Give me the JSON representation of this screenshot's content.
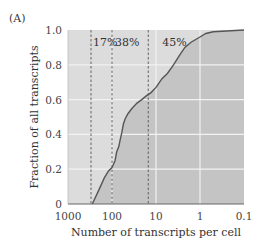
{
  "panel_label": "(A)",
  "colors": {
    "plot_bg": "#dcdcdc",
    "area_fill": "#c4c4c4",
    "curve": "#555555",
    "grid": "#f2f2f2",
    "dashed": "#555555",
    "axis": "#666666"
  },
  "chart_data": {
    "type": "area",
    "title": "",
    "xlabel": "Number of transcripts per cell",
    "ylabel": "Fraction of all transcripts",
    "x_scale": "log",
    "x_reversed": true,
    "xlim": [
      1000,
      0.1
    ],
    "ylim": [
      0,
      1.0
    ],
    "grid": true,
    "x_ticks": [
      "1000",
      "100",
      "10",
      "1",
      "0.1"
    ],
    "y_ticks": [
      "0",
      "0.2",
      "0.4",
      "0.6",
      "0.8",
      "1.0"
    ],
    "dashed_lines_x": [
      300,
      100,
      15
    ],
    "annotations": [
      {
        "text": "17%",
        "region": "300–100"
      },
      {
        "text": "38%",
        "region": "100–15"
      },
      {
        "text": "45%",
        "region": "15–0.1"
      }
    ],
    "series": [
      {
        "name": "cumulative fraction",
        "x": [
          280,
          200,
          150,
          120,
          100,
          85,
          78,
          70,
          65,
          60,
          55,
          50,
          43,
          35,
          27,
          21,
          17,
          13,
          10,
          7.3,
          5.5,
          4.0,
          3.0,
          2.2,
          1.6,
          1.0,
          0.74,
          0.5,
          0.1
        ],
        "y": [
          0.0,
          0.08,
          0.15,
          0.19,
          0.21,
          0.25,
          0.3,
          0.33,
          0.37,
          0.41,
          0.46,
          0.49,
          0.52,
          0.55,
          0.58,
          0.6,
          0.62,
          0.64,
          0.67,
          0.72,
          0.75,
          0.8,
          0.85,
          0.9,
          0.93,
          0.96,
          0.98,
          0.99,
          1.0
        ]
      }
    ]
  }
}
